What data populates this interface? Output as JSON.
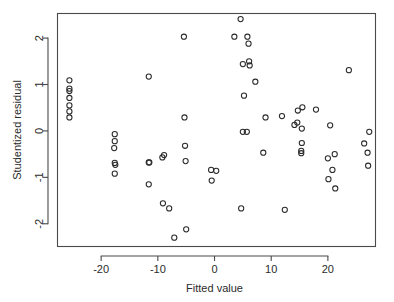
{
  "chart_data": {
    "type": "scatter",
    "title": "",
    "xlabel": "Fitted value",
    "ylabel": "Studentized residual",
    "xlim": [
      -27.7,
      28.4
    ],
    "ylim": [
      -2.49,
      2.53
    ],
    "xticks": [
      -20,
      -10,
      0,
      10,
      20
    ],
    "xtick_labels": [
      "-20",
      "-10",
      "0",
      "10",
      "20"
    ],
    "yticks": [
      2,
      1,
      0,
      -1,
      -2
    ],
    "ytick_labels": [
      "2",
      "1",
      "0",
      "-1",
      "-2"
    ],
    "grid": false,
    "legend": null,
    "marker": "open-circle",
    "series": [
      {
        "name": "residuals",
        "points": [
          [
            -25.6,
            1.09
          ],
          [
            -25.6,
            0.91
          ],
          [
            -25.6,
            0.86
          ],
          [
            -25.6,
            0.71
          ],
          [
            -25.6,
            0.55
          ],
          [
            -25.6,
            0.42
          ],
          [
            -25.6,
            0.29
          ],
          [
            -17.6,
            -0.07
          ],
          [
            -17.6,
            -0.22
          ],
          [
            -17.7,
            -0.37
          ],
          [
            -17.6,
            -0.69
          ],
          [
            -17.5,
            -0.73
          ],
          [
            -17.6,
            -0.92
          ],
          [
            -11.6,
            1.17
          ],
          [
            -11.6,
            -0.68
          ],
          [
            -11.5,
            -0.68
          ],
          [
            -11.6,
            -1.15
          ],
          [
            -9.2,
            -0.57
          ],
          [
            -8.9,
            -0.52
          ],
          [
            -9.1,
            -1.56
          ],
          [
            -8.0,
            -1.67
          ],
          [
            -7.1,
            -2.3
          ],
          [
            -5.4,
            2.03
          ],
          [
            -5.3,
            0.29
          ],
          [
            -5.2,
            -0.32
          ],
          [
            -5.1,
            -0.65
          ],
          [
            -5.0,
            -2.12
          ],
          [
            -0.6,
            -0.84
          ],
          [
            0.3,
            -0.86
          ],
          [
            -0.5,
            -1.07
          ],
          [
            4.6,
            2.41
          ],
          [
            3.5,
            2.03
          ],
          [
            5.8,
            2.03
          ],
          [
            6.0,
            1.88
          ],
          [
            5.0,
            1.44
          ],
          [
            6.1,
            1.5
          ],
          [
            6.2,
            1.41
          ],
          [
            7.2,
            1.06
          ],
          [
            5.2,
            0.76
          ],
          [
            5.0,
            -0.02
          ],
          [
            5.7,
            -0.02
          ],
          [
            4.7,
            -1.67
          ],
          [
            9.0,
            0.29
          ],
          [
            8.6,
            -0.47
          ],
          [
            11.9,
            0.32
          ],
          [
            12.4,
            -1.7
          ],
          [
            14.7,
            0.44
          ],
          [
            15.5,
            0.51
          ],
          [
            14.6,
            0.18
          ],
          [
            14.1,
            0.13
          ],
          [
            15.4,
            0.05
          ],
          [
            15.4,
            -0.26
          ],
          [
            15.3,
            -0.43
          ],
          [
            15.3,
            -0.48
          ],
          [
            17.9,
            0.46
          ],
          [
            20.4,
            0.12
          ],
          [
            21.2,
            -0.5
          ],
          [
            20.0,
            -0.59
          ],
          [
            20.8,
            -0.84
          ],
          [
            20.1,
            -1.04
          ],
          [
            21.3,
            -1.24
          ],
          [
            23.7,
            1.31
          ],
          [
            27.3,
            -0.02
          ],
          [
            26.4,
            -0.27
          ],
          [
            27.0,
            -0.47
          ],
          [
            27.1,
            -0.75
          ]
        ]
      }
    ]
  },
  "style": {
    "point_color": "#2a2a2a",
    "axis_color": "#4a4a4a",
    "background": "#ffffff"
  }
}
